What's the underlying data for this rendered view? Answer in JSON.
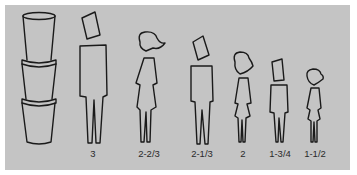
{
  "diagram": {
    "panel_color": "#c4c4c4",
    "line_color": "#1a1a1a",
    "left_item": "stacked-cups",
    "cups_count": 3,
    "figures": [
      {
        "type": "man",
        "label": "3",
        "x": 93
      },
      {
        "type": "woman",
        "label": "2-2/3",
        "x": 149
      },
      {
        "type": "man",
        "label": "2-1/3",
        "x": 202
      },
      {
        "type": "girl",
        "label": "2",
        "x": 243
      },
      {
        "type": "boy",
        "label": "1-3/4",
        "x": 278
      },
      {
        "type": "girl",
        "label": "1-1/2",
        "x": 314
      }
    ]
  }
}
